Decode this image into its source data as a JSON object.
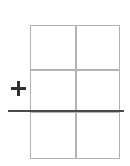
{
  "canvas": {
    "width": 130,
    "height": 166,
    "background_color": "#ffffff"
  },
  "table": {
    "columns": 2,
    "rows": 3,
    "grid_line_color": "#b3b3b3",
    "cell_fill_color": "#ffffff",
    "bounds": {
      "left": 30,
      "top": 25,
      "right": 120,
      "bottom": 159
    },
    "column_divider_x": [
      75
    ],
    "row_divider_y": [
      69,
      111
    ],
    "cells": [
      {
        "row": 1,
        "col": 1,
        "text": ""
      },
      {
        "row": 1,
        "col": 2,
        "text": ""
      },
      {
        "row": 2,
        "col": 1,
        "text": ""
      },
      {
        "row": 2,
        "col": 2,
        "text": ""
      },
      {
        "row": 3,
        "col": 1,
        "text": ""
      },
      {
        "row": 3,
        "col": 2,
        "text": ""
      }
    ]
  },
  "insert_rule": {
    "label": "",
    "color": "#4a4a4a",
    "y": 111,
    "start_x": 8,
    "end_x": 124,
    "thickness": 2.6
  },
  "plus_handle": {
    "icon": "plus-icon",
    "glyph": "+",
    "label": "",
    "color": "#2f2f2f",
    "center_x": 19,
    "center_y": 89,
    "size": 15
  }
}
